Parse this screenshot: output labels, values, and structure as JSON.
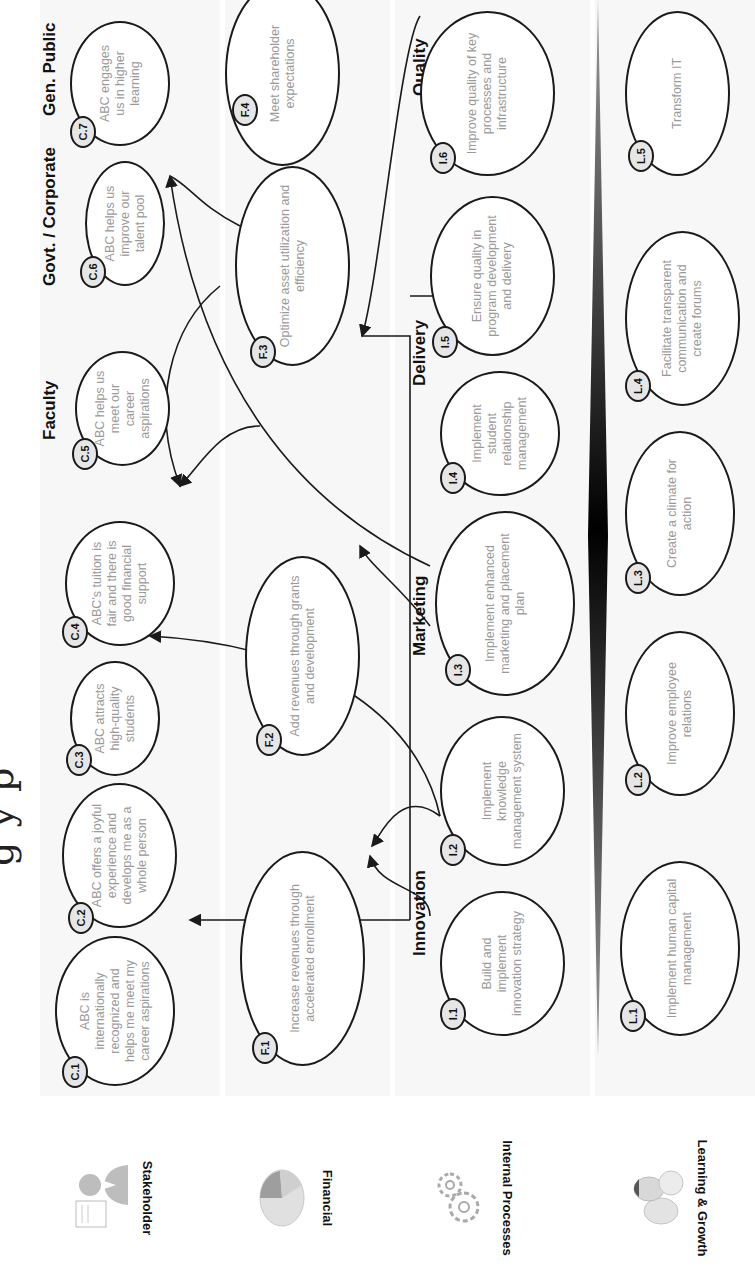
{
  "title_fragment": "g y   p",
  "perspectives": [
    {
      "label": "Stakeholder",
      "icon": "person-with-document-icon"
    },
    {
      "label": "Financial",
      "icon": "pie-chart-icon"
    },
    {
      "label": "Internal Processes",
      "icon": "gears-icon"
    },
    {
      "label": "Learning & Growth",
      "icon": "eggs-hatching-icon"
    }
  ],
  "groups": {
    "faculty": "Faculty",
    "govt_corporate": "Govt. / Corporate",
    "gen_public": "Gen. Public",
    "innovation": "Innovation",
    "marketing": "Marketing",
    "delivery": "Delivery",
    "quality": "Quality"
  },
  "stakeholder": [
    {
      "id": "C.1",
      "text": "ABC is internationally recognized and helps me meet my career aspirations"
    },
    {
      "id": "C.2",
      "text": "ABC offers a joyful experience and develops me as a whole person"
    },
    {
      "id": "C.3",
      "text": "ABC attracts high-quality students"
    },
    {
      "id": "C.4",
      "text": "ABC's tuition is fair and there is good financial support"
    },
    {
      "id": "C.5",
      "text": "ABC helps us meet our career aspirations"
    },
    {
      "id": "C.6",
      "text": "ABC helps us improve our talent pool"
    },
    {
      "id": "C.7",
      "text": "ABC engages us in higher learning"
    }
  ],
  "financial": [
    {
      "id": "F.1",
      "text": "Increase revenues through accelerated enrollment"
    },
    {
      "id": "F.2",
      "text": "Add revenues through grants and development"
    },
    {
      "id": "F.3",
      "text": "Optimize asset utilization and efficiency"
    },
    {
      "id": "F.4",
      "text": "Meet shareholder expectations"
    }
  ],
  "internal": [
    {
      "id": "I.1",
      "text": "Build and implement innovation strategy"
    },
    {
      "id": "I.2",
      "text": "Implement knowledge management system"
    },
    {
      "id": "I.3",
      "text": "Implement enhanced marketing and placement plan"
    },
    {
      "id": "I.4",
      "text": "Implement student relationship management"
    },
    {
      "id": "I.5",
      "text": "Ensure quality in program development and delivery"
    },
    {
      "id": "I.6",
      "text": "Improve quality of key processes and infrastructure"
    }
  ],
  "learning": [
    {
      "id": "L.1",
      "text": "Implement human capital management"
    },
    {
      "id": "L.2",
      "text": "Improve employee relations"
    },
    {
      "id": "L.3",
      "text": "Create a climate for action"
    },
    {
      "id": "L.4",
      "text": "Facilitate transparent communication and create forums"
    },
    {
      "id": "L.5",
      "text": "Transform IT"
    }
  ],
  "colors": {
    "line": "#1a1a1a",
    "node_text": "#9a9a9a",
    "badge_fill": "#e6e6e6",
    "band": "#f7f7f7"
  }
}
